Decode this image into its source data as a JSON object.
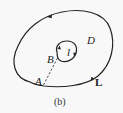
{
  "diagram": {
    "caption": "(b)",
    "labels": {
      "region": "D",
      "outer_curve": "L",
      "inner_curve": "l",
      "point_outer": "A",
      "point_inner": "B"
    },
    "elements": {
      "outer_curve": {
        "type": "closed-curve",
        "orientation": "counterclockwise",
        "color": "#222222"
      },
      "inner_curve": {
        "type": "closed-curve",
        "orientation": "clockwise",
        "color": "#222222"
      },
      "cut_segment": {
        "type": "dashed-line",
        "from": "A",
        "to": "B",
        "color": "#333333"
      }
    }
  }
}
